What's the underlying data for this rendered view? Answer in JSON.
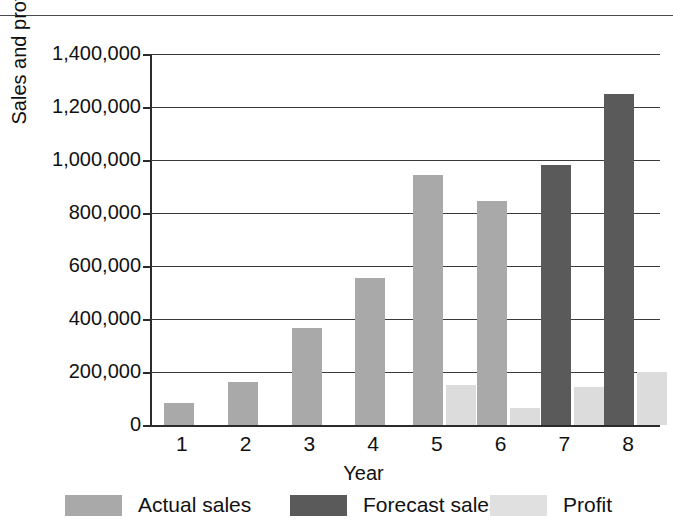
{
  "chart_data": {
    "type": "bar",
    "title": "",
    "xlabel": "Year",
    "ylabel": "Sales and profit",
    "categories": [
      "1",
      "2",
      "3",
      "4",
      "5",
      "6",
      "7",
      "8"
    ],
    "ylim": [
      0,
      1400000
    ],
    "yticks": [
      0,
      200000,
      400000,
      600000,
      800000,
      1000000,
      1200000,
      1400000
    ],
    "ytick_labels": [
      "0",
      "200,000",
      "400,000",
      "600,000",
      "800,000",
      "1,000,000",
      "1,200,000",
      "1,400,000"
    ],
    "grid": true,
    "legend_position": "bottom",
    "series": [
      {
        "name": "Actual sales",
        "color": "#a9a9a9",
        "values": [
          83000,
          163000,
          365000,
          553000,
          943000,
          845000,
          null,
          null
        ]
      },
      {
        "name": "Forecast sales",
        "color": "#5a5a5a",
        "values": [
          null,
          null,
          null,
          null,
          null,
          null,
          983000,
          1248000
        ]
      },
      {
        "name": "Profit",
        "color": "#e0e0e0",
        "values": [
          null,
          null,
          null,
          null,
          150000,
          63000,
          142000,
          200000
        ]
      }
    ]
  },
  "legend": {
    "items": [
      {
        "label": "Actual sales",
        "swatch": "actual"
      },
      {
        "label": "Forecast sales",
        "swatch": "forecast"
      },
      {
        "label": "Profit",
        "swatch": "profit"
      }
    ]
  }
}
